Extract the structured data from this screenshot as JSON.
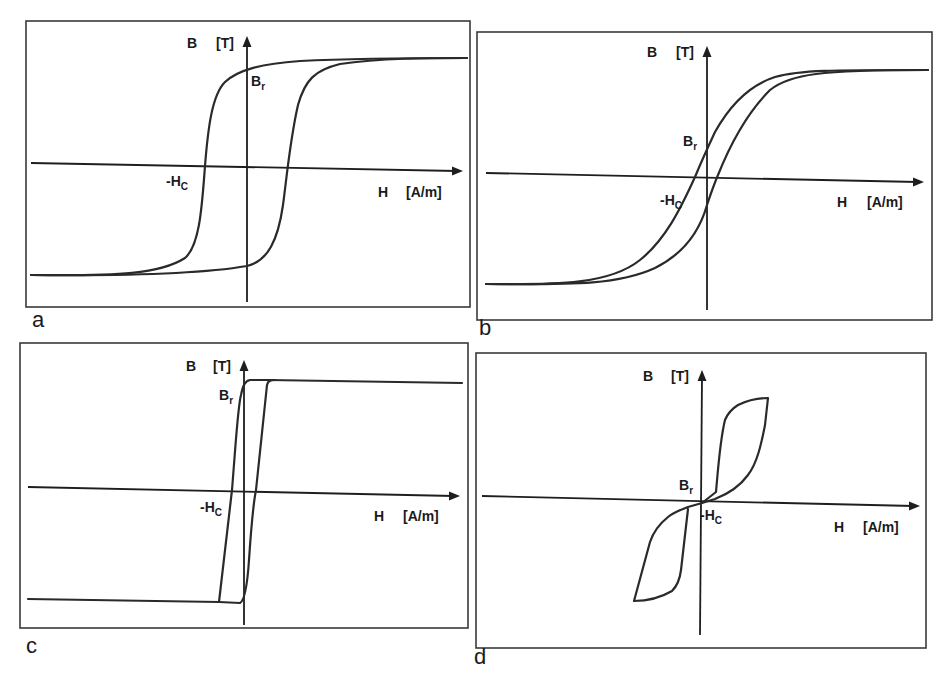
{
  "figure": {
    "panels": [
      {
        "id": "a",
        "letter": "a",
        "frame": {
          "x": 26,
          "y": 21,
          "w": 444,
          "h": 286
        },
        "axis_origin": {
          "x": 247,
          "y": 166
        },
        "h_axis": {
          "x1": 31,
          "y1": 163,
          "x2": 463,
          "y2": 171
        },
        "b_axis": {
          "x1": 247,
          "y1": 302,
          "x2": 247,
          "y2": 36
        },
        "labels": {
          "b": {
            "text": "B",
            "x": 187,
            "y": 48
          },
          "b_unit": {
            "text": "[T]",
            "x": 216,
            "y": 48
          },
          "br": {
            "main": "B",
            "sub": "r",
            "x": 251,
            "y": 86
          },
          "hc": {
            "main": "-H",
            "sub": "C",
            "x": 166,
            "y": 186
          },
          "h": {
            "text": "H",
            "x": 378,
            "y": 197
          },
          "h_unit": {
            "text": "[A/m]",
            "x": 406,
            "y": 197
          },
          "letter": {
            "x": 32,
            "y": 327
          }
        },
        "curves": [
          "M31,275 C120,276 160,274 185,258 C200,245 202,205 205,166 C208,128 212,95 225,82 C238,70 260,64 300,61 C360,58 420,58 467,58",
          "M31,275 C120,276 200,274 247,266 C268,261 278,240 283,205 C287,175 290,140 298,105 C305,80 315,70 340,64 C380,58 430,58 467,58"
        ],
        "annotations": [
          "B [T]",
          "Br",
          "-Hc",
          "H [A/m]"
        ]
      },
      {
        "id": "b",
        "letter": "b",
        "frame": {
          "x": 477,
          "y": 32,
          "w": 455,
          "h": 288
        },
        "axis_origin": {
          "x": 707,
          "y": 177
        },
        "h_axis": {
          "x1": 486,
          "y1": 173,
          "x2": 924,
          "y2": 182
        },
        "b_axis": {
          "x1": 707,
          "y1": 310,
          "x2": 707,
          "y2": 46
        },
        "labels": {
          "b": {
            "text": "B",
            "x": 647,
            "y": 57
          },
          "b_unit": {
            "text": "[T]",
            "x": 676,
            "y": 57
          },
          "br": {
            "main": "B",
            "sub": "r",
            "x": 683,
            "y": 146
          },
          "hc": {
            "main": "-H",
            "sub": "C",
            "x": 660,
            "y": 205
          },
          "h": {
            "text": "H",
            "x": 837,
            "y": 207
          },
          "h_unit": {
            "text": "[A/m]",
            "x": 867,
            "y": 207
          },
          "letter": {
            "x": 479,
            "y": 335
          }
        },
        "curves": [
          "M486,284 C560,285 610,284 640,260 C665,240 680,210 695,177 C702,160 708,147 715,132 C730,105 750,85 775,77 C800,70 830,70 928,70",
          "M486,284 C580,285 620,284 655,268 C685,253 700,230 707,205 C712,190 715,182 718,175 C728,150 745,115 770,90 C790,74 820,70 928,70"
        ],
        "annotations": [
          "B [T]",
          "Br",
          "-Hc",
          "H [A/m]"
        ]
      },
      {
        "id": "c",
        "letter": "c",
        "frame": {
          "x": 20,
          "y": 343,
          "w": 448,
          "h": 285
        },
        "axis_origin": {
          "x": 244,
          "y": 490
        },
        "h_axis": {
          "x1": 28,
          "y1": 487,
          "x2": 460,
          "y2": 496
        },
        "b_axis": {
          "x1": 244,
          "y1": 625,
          "x2": 244,
          "y2": 360
        },
        "labels": {
          "b": {
            "text": "B",
            "x": 186,
            "y": 371
          },
          "b_unit": {
            "text": "[T]",
            "x": 213,
            "y": 371
          },
          "br": {
            "main": "B",
            "sub": "r",
            "x": 219,
            "y": 400
          },
          "hc": {
            "main": "-H",
            "sub": "C",
            "x": 200,
            "y": 512
          },
          "h": {
            "text": "H",
            "x": 374,
            "y": 521
          },
          "h_unit": {
            "text": "[A/m]",
            "x": 403,
            "y": 521
          },
          "letter": {
            "x": 26,
            "y": 653
          }
        },
        "curves": [
          "M28,599 L219,602 L232,490 C236,440 238,405 241,395 C243,385 245,381 250,380 L268,380 L462,383",
          "M219,602 L240,603 C244,601 247,590 249,560 C251,530 253,505 256,490 L267,385 C268,381 270,380 275,380"
        ],
        "annotations": [
          "B [T]",
          "Br",
          "-Hc",
          "H [A/m]"
        ]
      },
      {
        "id": "d",
        "letter": "d",
        "frame": {
          "x": 476,
          "y": 353,
          "w": 450,
          "h": 295
        },
        "axis_origin": {
          "x": 702,
          "y": 503
        },
        "h_axis": {
          "x1": 482,
          "y1": 496,
          "x2": 920,
          "y2": 506
        },
        "b_axis": {
          "x1": 700,
          "y1": 635,
          "x2": 702,
          "y2": 370
        },
        "labels": {
          "b": {
            "text": "B",
            "x": 643,
            "y": 381
          },
          "b_unit": {
            "text": "[T]",
            "x": 671,
            "y": 381
          },
          "br": {
            "main": "B",
            "sub": "r",
            "x": 679,
            "y": 490
          },
          "hc": {
            "main": "-H",
            "sub": "C",
            "x": 700,
            "y": 520
          },
          "h": {
            "text": "H",
            "x": 834,
            "y": 532
          },
          "h_unit": {
            "text": "[A/m]",
            "x": 863,
            "y": 532
          },
          "letter": {
            "x": 474,
            "y": 664
          }
        },
        "curves": [
          "M702,503 L715,499 C728,494 740,486 748,475 C758,462 762,440 765,425 L768,398 C760,398 748,400 738,405 C730,410 727,415 725,420 C720,440 718,470 716,492 L702,503",
          "M702,503 L688,507 C680,510 674,512 668,517 C658,525 653,533 650,542 L634,601 C645,601 660,598 672,591 C678,585 680,578 681,570 L688,509"
        ],
        "annotations": [
          "B [T]",
          "Br",
          "-Hc",
          "H [A/m]"
        ]
      }
    ],
    "panel_letters": [
      "a",
      "b",
      "c",
      "d"
    ],
    "axis_labels": {
      "y_symbol": "B",
      "y_unit": "[T]",
      "x_symbol": "H",
      "x_unit": "[A/m]"
    },
    "point_labels": {
      "remanence": "Br",
      "coercivity": "-Hc"
    },
    "colors": {
      "line": "#2a2a2a",
      "frame": "#3a3a3a",
      "background": "#ffffff"
    }
  }
}
